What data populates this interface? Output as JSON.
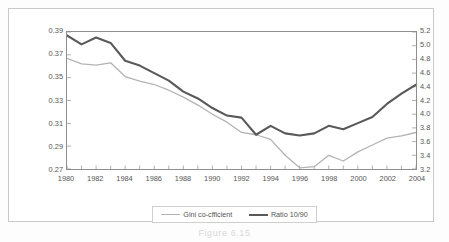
{
  "figure": {
    "caption": "Figure 6.15"
  },
  "legend": {
    "position": "bottom-center",
    "entries": [
      {
        "label": "Gini co-cfficient",
        "color": "#b3b3b3",
        "width": 1.3
      },
      {
        "label": "Ratio 10/90",
        "color": "#595959",
        "width": 2.1
      }
    ]
  },
  "chart_data": {
    "type": "line",
    "title": "",
    "xlabel": "",
    "ylabel": "",
    "grid": false,
    "x": [
      1980,
      1981,
      1982,
      1983,
      1984,
      1985,
      1986,
      1987,
      1988,
      1989,
      1990,
      1991,
      1992,
      1993,
      1994,
      1995,
      1996,
      1997,
      1998,
      1999,
      2000,
      2001,
      2002,
      2003,
      2004
    ],
    "xlim": [
      1980,
      2004
    ],
    "xtick_labels": [
      "1980",
      "1982",
      "1984",
      "1986",
      "1988",
      "1990",
      "1992",
      "1994",
      "1996",
      "1998",
      "2000",
      "2002",
      "2004"
    ],
    "xtick_values": [
      1980,
      1982,
      1984,
      1986,
      1988,
      1990,
      1992,
      1994,
      1996,
      1998,
      2000,
      2002,
      2004
    ],
    "axes": [
      {
        "id": "left",
        "name": "Gini co-cfficient",
        "ylim": [
          0.27,
          0.39
        ],
        "ticks": [
          0.27,
          0.29,
          0.31,
          0.33,
          0.35,
          0.37,
          0.39
        ],
        "tick_labels": [
          "0.27",
          "0.29",
          "0.31",
          "0.33",
          "0.35",
          "0.37",
          "0.39"
        ]
      },
      {
        "id": "right",
        "name": "Ratio 10/90",
        "ylim": [
          3.2,
          5.2
        ],
        "ticks": [
          3.2,
          3.4,
          3.6,
          3.8,
          4.0,
          4.2,
          4.4,
          4.6,
          4.8,
          5.0,
          5.2
        ],
        "tick_labels": [
          "3.2",
          "3.4",
          "3.6",
          "3.8",
          "4.0",
          "4.2",
          "4.4",
          "4.6",
          "4.8",
          "5.0",
          "5.2"
        ]
      }
    ],
    "series": [
      {
        "name": "Gini co-cfficient",
        "axis": "left",
        "color": "#b3b3b3",
        "width": 1.3,
        "values": [
          0.367,
          0.362,
          0.361,
          0.363,
          0.351,
          0.347,
          0.344,
          0.339,
          0.333,
          0.326,
          0.318,
          0.311,
          0.302,
          0.3,
          0.296,
          0.282,
          0.271,
          0.272,
          0.282,
          0.277,
          0.285,
          0.291,
          0.297,
          0.299,
          0.302
        ]
      },
      {
        "name": "Ratio 10/90",
        "axis": "right",
        "color": "#595959",
        "width": 2.1,
        "values": [
          5.15,
          5.02,
          5.12,
          5.04,
          4.78,
          4.71,
          4.6,
          4.49,
          4.33,
          4.23,
          4.09,
          3.98,
          3.95,
          3.7,
          3.83,
          3.72,
          3.69,
          3.72,
          3.83,
          3.78,
          3.87,
          3.96,
          4.15,
          4.3,
          4.43
        ]
      }
    ]
  }
}
